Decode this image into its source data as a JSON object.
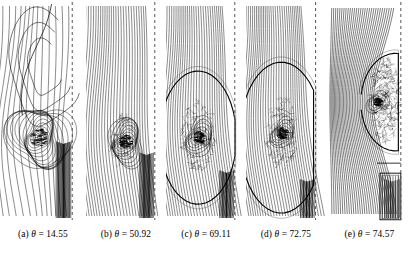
{
  "figure": {
    "type": "contour-plot-series",
    "background_color": "#ffffff",
    "line_color": "#000000",
    "dashed_axis_color": "#555555",
    "panel_count": 5
  },
  "panels": [
    {
      "id": "a",
      "caption": {
        "label": "(a)",
        "symbol": "θ",
        "equals": "=",
        "value": "14.55"
      },
      "width": 86,
      "height": 222,
      "axis_x_frac": 0.84,
      "core": {
        "cx_frac": 0.46,
        "cy_frac": 0.62,
        "radius_frac": 0.3,
        "density": 16,
        "blob_r": 7.5,
        "blob_intensity": 0.95
      },
      "style": "spiral",
      "stream_count": 13,
      "stream_tilt": 0.1,
      "wake_lines": 13,
      "wake_top_frac": 0.63,
      "has_lower_box": false,
      "bow_arc": false,
      "upper_lobe": {
        "enabled": true,
        "cx_frac": 0.52,
        "cy_frac": 0.3,
        "rx_frac": 0.4,
        "ry_frac": 0.26,
        "rings": 3
      },
      "diffuse_cloud": {
        "enabled": false,
        "cx_frac": 0.46,
        "cy_frac": 0.62,
        "rx_frac": 0.25,
        "ry_frac": 0.2,
        "dots": 0
      }
    },
    {
      "id": "b",
      "caption": {
        "label": "(b)",
        "symbol": "θ",
        "equals": "=",
        "value": "50.92"
      },
      "width": 80,
      "height": 222,
      "axis_x_frac": 0.86,
      "core": {
        "cx_frac": 0.5,
        "cy_frac": 0.64,
        "radius_frac": 0.2,
        "density": 11,
        "blob_r": 5.5,
        "blob_intensity": 0.92
      },
      "style": "swept",
      "stream_count": 26,
      "stream_tilt": 0.34,
      "wake_lines": 12,
      "wake_top_frac": 0.68,
      "has_lower_box": false,
      "bow_arc": false,
      "upper_lobe": {
        "enabled": false,
        "cx_frac": 0.5,
        "cy_frac": 0.3,
        "rx_frac": 0.3,
        "ry_frac": 0.2,
        "rings": 0
      },
      "diffuse_cloud": {
        "enabled": true,
        "cx_frac": 0.46,
        "cy_frac": 0.63,
        "rx_frac": 0.17,
        "ry_frac": 0.12,
        "dots": 110
      }
    },
    {
      "id": "c",
      "caption": {
        "label": "(c)",
        "symbol": "θ",
        "equals": "=",
        "value": "69.11"
      },
      "width": 80,
      "height": 222,
      "axis_x_frac": 0.86,
      "core": {
        "cx_frac": 0.42,
        "cy_frac": 0.62,
        "radius_frac": 0.16,
        "density": 8,
        "blob_r": 5.0,
        "blob_intensity": 0.88
      },
      "style": "swept",
      "stream_count": 28,
      "stream_tilt": 0.46,
      "wake_lines": 11,
      "wake_top_frac": 0.76,
      "has_lower_box": false,
      "bow_arc": true,
      "bow": {
        "cx_frac": 0.4,
        "cy_frac": 0.62,
        "rx_frac": 0.48,
        "ry_frac": 0.3,
        "top_frac": 0.42
      },
      "upper_lobe": {
        "enabled": false,
        "cx_frac": 0.5,
        "cy_frac": 0.3,
        "rx_frac": 0.3,
        "ry_frac": 0.2,
        "rings": 0
      },
      "diffuse_cloud": {
        "enabled": true,
        "cx_frac": 0.4,
        "cy_frac": 0.61,
        "rx_frac": 0.22,
        "ry_frac": 0.16,
        "dots": 190
      }
    },
    {
      "id": "d",
      "caption": {
        "label": "(d)",
        "symbol": "θ",
        "equals": "=",
        "value": "72.75"
      },
      "width": 80,
      "height": 222,
      "axis_x_frac": 0.87,
      "core": {
        "cx_frac": 0.46,
        "cy_frac": 0.6,
        "radius_frac": 0.13,
        "density": 7,
        "blob_r": 4.5,
        "blob_intensity": 0.85
      },
      "style": "swept",
      "stream_count": 30,
      "stream_tilt": 0.52,
      "wake_lines": 10,
      "wake_top_frac": 0.8,
      "has_lower_box": false,
      "bow_arc": true,
      "bow": {
        "cx_frac": 0.44,
        "cy_frac": 0.62,
        "rx_frac": 0.52,
        "ry_frac": 0.34,
        "top_frac": 0.34
      },
      "upper_lobe": {
        "enabled": false,
        "cx_frac": 0.5,
        "cy_frac": 0.3,
        "rx_frac": 0.3,
        "ry_frac": 0.2,
        "rings": 0
      },
      "diffuse_cloud": {
        "enabled": true,
        "cx_frac": 0.45,
        "cy_frac": 0.6,
        "rx_frac": 0.2,
        "ry_frac": 0.17,
        "dots": 210
      }
    },
    {
      "id": "e",
      "caption": {
        "label": "(e)",
        "symbol": "θ",
        "equals": "=",
        "value": "74.57"
      },
      "width": 87,
      "height": 222,
      "axis_x_frac": 0.86,
      "core": {
        "cx_frac": 0.6,
        "cy_frac": 0.46,
        "radius_frac": 0.1,
        "density": 5,
        "blob_r": 3.5,
        "blob_intensity": 0.8
      },
      "style": "radial",
      "stream_count": 30,
      "stream_tilt": 0.0,
      "wake_lines": 8,
      "wake_top_frac": 0.8,
      "has_lower_box": true,
      "lower_box": {
        "x_frac": 0.62,
        "y_frac": 0.78,
        "w_frac": 0.24,
        "h_frac": 0.21,
        "inner_lines": 7
      },
      "bow_arc": true,
      "bow": {
        "cx_frac": 0.8,
        "cy_frac": 0.46,
        "rx_frac": 0.4,
        "ry_frac": 0.22,
        "top_frac": 0.24
      },
      "upper_lobe": {
        "enabled": false,
        "cx_frac": 0.5,
        "cy_frac": 0.3,
        "rx_frac": 0.3,
        "ry_frac": 0.2,
        "rings": 0
      },
      "diffuse_cloud": {
        "enabled": true,
        "cx_frac": 0.68,
        "cy_frac": 0.45,
        "rx_frac": 0.18,
        "ry_frac": 0.19,
        "dots": 420
      }
    }
  ]
}
